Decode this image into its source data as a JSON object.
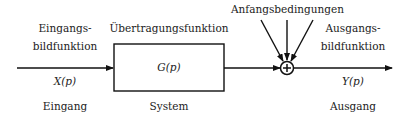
{
  "diagram": {
    "type": "block-diagram",
    "input": {
      "top_label_line1": "Eingangs-",
      "top_label_line2": "bildfunktion",
      "signal": "X(p)",
      "bottom_label": "Eingang"
    },
    "system": {
      "top_label": "Übertragungsfunktion",
      "block_text": "G(p)",
      "bottom_label": "System"
    },
    "summing_junction": {
      "symbol": "+",
      "top_label": "Anfangsbedingungen",
      "incoming_arrows": 3
    },
    "output": {
      "top_label_line1": "Ausgangs-",
      "top_label_line2": "bildfunktion",
      "signal": "Y(p)",
      "bottom_label": "Ausgang"
    },
    "colors": {
      "line": "#111111",
      "text": "#222222",
      "background": "#ffffff"
    }
  }
}
